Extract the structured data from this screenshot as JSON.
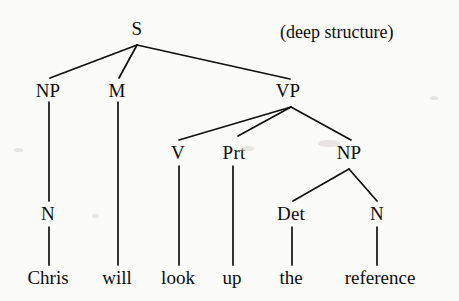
{
  "figure": {
    "caption": "(deep structure)",
    "caption_x": 280,
    "caption_y": 22,
    "background_color": "#fbfbfa",
    "ink_color": "#101010",
    "width": 459,
    "height": 301
  },
  "tree": {
    "sentence": "Chris will look up the reference",
    "nodes": [
      {
        "id": "S",
        "label": "S",
        "x": 137,
        "y": 28,
        "kind": "category"
      },
      {
        "id": "NP1",
        "label": "NP",
        "x": 48,
        "y": 90,
        "kind": "category"
      },
      {
        "id": "M",
        "label": "M",
        "x": 117,
        "y": 90,
        "kind": "category"
      },
      {
        "id": "VP",
        "label": "VP",
        "x": 288,
        "y": 90,
        "kind": "category"
      },
      {
        "id": "N1",
        "label": "N",
        "x": 48,
        "y": 213,
        "kind": "category"
      },
      {
        "id": "V",
        "label": "V",
        "x": 178,
        "y": 152,
        "kind": "category"
      },
      {
        "id": "Prt",
        "label": "Prt",
        "x": 234,
        "y": 152,
        "kind": "category"
      },
      {
        "id": "NP2",
        "label": "NP",
        "x": 349,
        "y": 152,
        "kind": "category"
      },
      {
        "id": "Det",
        "label": "Det",
        "x": 291,
        "y": 213,
        "kind": "category"
      },
      {
        "id": "N2",
        "label": "N",
        "x": 377,
        "y": 213,
        "kind": "category"
      },
      {
        "id": "w1",
        "label": "Chris",
        "x": 48,
        "y": 277,
        "kind": "leaf"
      },
      {
        "id": "w2",
        "label": "will",
        "x": 117,
        "y": 277,
        "kind": "leaf"
      },
      {
        "id": "w3",
        "label": "look",
        "x": 178,
        "y": 277,
        "kind": "leaf"
      },
      {
        "id": "w4",
        "label": "up",
        "x": 232,
        "y": 277,
        "kind": "leaf"
      },
      {
        "id": "w5",
        "label": "the",
        "x": 291,
        "y": 277,
        "kind": "leaf"
      },
      {
        "id": "w6",
        "label": "reference",
        "x": 380,
        "y": 277,
        "kind": "leaf"
      }
    ],
    "edges": [
      {
        "from": "S",
        "to": "NP1",
        "x1": 137,
        "y1": 45,
        "x2": 50,
        "y2": 78
      },
      {
        "from": "S",
        "to": "M",
        "x1": 137,
        "y1": 45,
        "x2": 119,
        "y2": 78
      },
      {
        "from": "S",
        "to": "VP",
        "x1": 137,
        "y1": 45,
        "x2": 290,
        "y2": 79
      },
      {
        "from": "NP1",
        "to": "N1",
        "x1": 49,
        "y1": 102,
        "x2": 49,
        "y2": 201
      },
      {
        "from": "M",
        "to": "w2",
        "x1": 118,
        "y1": 102,
        "x2": 118,
        "y2": 265
      },
      {
        "from": "VP",
        "to": "V",
        "x1": 291,
        "y1": 107,
        "x2": 179,
        "y2": 140
      },
      {
        "from": "VP",
        "to": "Prt",
        "x1": 291,
        "y1": 107,
        "x2": 238,
        "y2": 136
      },
      {
        "from": "VP",
        "to": "NP2",
        "x1": 291,
        "y1": 107,
        "x2": 351,
        "y2": 140
      },
      {
        "from": "N1",
        "to": "w1",
        "x1": 49,
        "y1": 227,
        "x2": 49,
        "y2": 265
      },
      {
        "from": "V",
        "to": "w3",
        "x1": 179,
        "y1": 166,
        "x2": 179,
        "y2": 265
      },
      {
        "from": "Prt",
        "to": "w4",
        "x1": 233,
        "y1": 166,
        "x2": 233,
        "y2": 265
      },
      {
        "from": "NP2",
        "to": "Det",
        "x1": 349,
        "y1": 169,
        "x2": 293,
        "y2": 201
      },
      {
        "from": "NP2",
        "to": "N2",
        "x1": 349,
        "y1": 169,
        "x2": 377,
        "y2": 201
      },
      {
        "from": "Det",
        "to": "w5",
        "x1": 292,
        "y1": 227,
        "x2": 292,
        "y2": 265
      },
      {
        "from": "N2",
        "to": "w6",
        "x1": 377,
        "y1": 227,
        "x2": 377,
        "y2": 265
      }
    ]
  }
}
